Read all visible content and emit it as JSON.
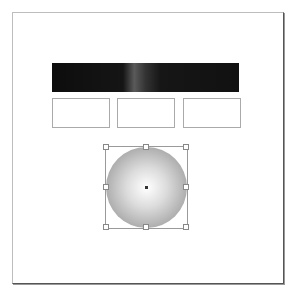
{
  "caption": {
    "text": ""
  },
  "canvas": {
    "gradient_bar": {
      "description": "black horizontal gradient bar with gray highlight"
    },
    "boxes": [
      {
        "label": ""
      },
      {
        "label": ""
      },
      {
        "label": ""
      }
    ],
    "selected_object": {
      "shape": "circle",
      "fill": "radial gradient white to gray",
      "handles": 8
    }
  },
  "colors": {
    "bar_dark": "#111111",
    "circle_edge": "#8a8a8a",
    "handle_border": "#888888"
  }
}
